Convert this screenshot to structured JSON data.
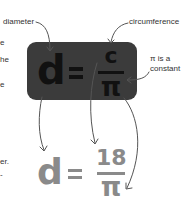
{
  "labels": {
    "diameter": "diameter",
    "circumference": "circumference",
    "pi_note_line1": "π is a",
    "pi_note_line2": "constant"
  },
  "formula_box": {
    "lhs": "d",
    "equals": "=",
    "numerator": "c",
    "denominator": "π",
    "background": "#3b3b3b",
    "text_color": "#111111"
  },
  "result_formula": {
    "lhs": "d",
    "equals": "=",
    "numerator": "18",
    "denominator": "π",
    "color": "#8a8a8a"
  },
  "left_fragments": [
    "e",
    "he",
    "e",
    "er.",
    "-"
  ]
}
